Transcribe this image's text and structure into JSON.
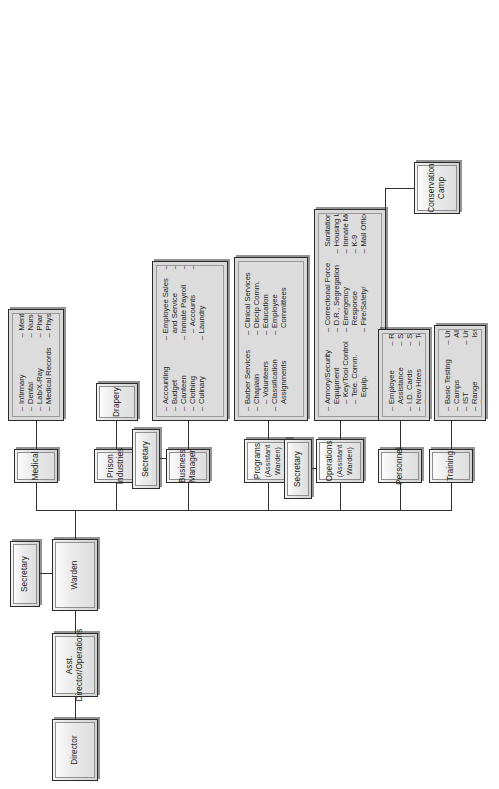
{
  "chart_data": {
    "type": "diagram",
    "orientation": "rotated-90",
    "root": "Director"
  },
  "nodes": {
    "director": {
      "label": "Director"
    },
    "asst_director": {
      "label": "Asst. Director/Operations"
    },
    "warden": {
      "label": "Warden"
    },
    "secretary_warden": {
      "label": "Secretary"
    },
    "secretary_business": {
      "label": "Secretary"
    },
    "secretary_ops": {
      "label": "Secretary"
    },
    "medical": {
      "label": "Medical"
    },
    "prison_industries": {
      "label": "Prison Industries"
    },
    "drapery": {
      "label": "Drapery"
    },
    "business_manager": {
      "label": "Business Manager"
    },
    "programs": {
      "label": "Programs\n(Assistant Warden)"
    },
    "programs_l1": {
      "label": "Programs"
    },
    "programs_l2": {
      "label": "(Assistant Warden)"
    },
    "operations_l1": {
      "label": "Operations"
    },
    "operations_l2": {
      "label": "(Assistant Warden)"
    },
    "personnel": {
      "label": "Personnel"
    },
    "training": {
      "label": "Training"
    },
    "conservation_l1": {
      "label": "Conservation"
    },
    "conservation_l2": {
      "label": "Camp"
    }
  },
  "lists": {
    "medical": [
      {
        "dash": "–",
        "text": "Infirmary"
      },
      {
        "dash": "–",
        "text": "Dental"
      },
      {
        "dash": "–",
        "text": "Lab/X-Ray"
      },
      {
        "dash": "–",
        "text": "Medical Records"
      },
      {
        "dash": "–",
        "text": "Mental Health"
      },
      {
        "dash": "–",
        "text": "Nurses"
      },
      {
        "dash": "–",
        "text": "Pharmacy"
      },
      {
        "dash": "–",
        "text": "Physical Ther."
      }
    ],
    "business_manager": [
      {
        "dash": "–",
        "text": "Accounting"
      },
      {
        "dash": "–",
        "text": "Budget"
      },
      {
        "dash": "–",
        "text": "Canteen"
      },
      {
        "dash": "–",
        "text": "Clothing"
      },
      {
        "dash": "–",
        "text": "Culinary"
      },
      {
        "dash": "–",
        "text": "Employee Sales"
      },
      {
        "dash": "",
        "text": "and Service"
      },
      {
        "dash": "–",
        "text": "Inmate Payroll"
      },
      {
        "dash": "–",
        "text": "Accounts",
        "sub": true
      },
      {
        "dash": "–",
        "text": "Laundry"
      },
      {
        "dash": "–",
        "text": "Maintenance"
      },
      {
        "dash": "–",
        "text": "Purchasing"
      },
      {
        "dash": "–",
        "text": "Vehicle Fleet"
      },
      {
        "dash": "–",
        "text": "Regional"
      },
      {
        "dash": "",
        "text": "Warehouse"
      }
    ],
    "programs": [
      {
        "dash": "–",
        "text": "Barber Services"
      },
      {
        "dash": "–",
        "text": "Chaplain"
      },
      {
        "dash": "–",
        "text": "Volunteers",
        "sub": true
      },
      {
        "dash": "–",
        "text": "Classification"
      },
      {
        "dash": "",
        "text": "Assignments"
      },
      {
        "dash": "–",
        "text": "Clinical Services"
      },
      {
        "dash": "–",
        "text": "Discip Comm."
      },
      {
        "dash": "–",
        "text": "Education"
      },
      {
        "dash": "–",
        "text": "Employee"
      },
      {
        "dash": "",
        "text": "Committees"
      },
      {
        "dash": "–",
        "text": "Employee Recog."
      },
      {
        "dash": "–",
        "text": "Library"
      },
      {
        "dash": "–",
        "text": "Records, Intake"
      },
      {
        "dash": "–",
        "text": "Recreation"
      },
      {
        "dash": "–",
        "text": "Tours"
      }
    ],
    "operations": [
      {
        "dash": "–",
        "text": "Armory/Security"
      },
      {
        "dash": "",
        "text": "Equipment"
      },
      {
        "dash": "–",
        "text": "Key/Tool Control",
        "sub": true
      },
      {
        "dash": "–",
        "text": "Tele. Comm.",
        "sub": true
      },
      {
        "dash": "",
        "text": "Equip.",
        "cont": true
      },
      {
        "dash": "–",
        "text": "Correctional Force"
      },
      {
        "dash": "–",
        "text": "D.R., Segregation"
      },
      {
        "dash": "–",
        "text": "Emergency"
      },
      {
        "dash": "",
        "text": "Response"
      },
      {
        "dash": "–",
        "text": "Fire/Safety/"
      },
      {
        "dash": "",
        "text": "Sanitation"
      },
      {
        "dash": "–",
        "text": "Housing Units"
      },
      {
        "dash": "–",
        "text": "Inmate Movement"
      },
      {
        "dash": "–",
        "text": "K-9"
      },
      {
        "dash": "–",
        "text": "Mail Officer"
      },
      {
        "dash": "–",
        "text": "Personal Property"
      },
      {
        "dash": "–",
        "text": "Search and Escort"
      },
      {
        "dash": "–",
        "text": "Security Squad"
      },
      {
        "dash": "–",
        "text": "Transportation"
      },
      {
        "dash": "–",
        "text": "Visiting Officer"
      }
    ],
    "personnel": [
      {
        "dash": "–",
        "text": "Employee"
      },
      {
        "dash": "",
        "text": "Assistance"
      },
      {
        "dash": "–",
        "text": "I.D. Cards"
      },
      {
        "dash": "–",
        "text": "New Hires"
      },
      {
        "dash": "–",
        "text": "Payroll"
      },
      {
        "dash": "–",
        "text": "Recruiting"
      },
      {
        "dash": "–",
        "text": "Staff Services"
      },
      {
        "dash": "–",
        "text": "Staff Transfers"
      },
      {
        "dash": "–",
        "text": "Testing"
      }
    ],
    "training": [
      {
        "dash": "–",
        "text": "Basic Testing"
      },
      {
        "dash": "–",
        "text": "Camps"
      },
      {
        "dash": "–",
        "text": "IST"
      },
      {
        "dash": "–",
        "text": "Range"
      },
      {
        "dash": "–",
        "text": "Testing"
      },
      {
        "dash": "–",
        "text": "Uniform"
      },
      {
        "dash": "",
        "text": "Allowances"
      },
      {
        "dash": "–",
        "text": "Uniform/Equip."
      },
      {
        "dash": "",
        "text": "Issue"
      }
    ]
  }
}
